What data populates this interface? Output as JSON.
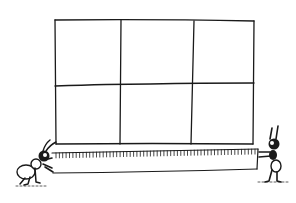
{
  "illustration": {
    "subject": "Two ants measuring a rectangle with a measuring tape",
    "grid": {
      "rows": 2,
      "cols": 3
    },
    "tape": {
      "ticks": 60
    },
    "ink_color": "#1a1a1a",
    "background": "#ffffff"
  }
}
